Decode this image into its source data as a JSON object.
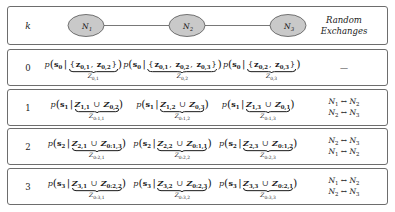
{
  "figure": {
    "k_column_header": "k",
    "exchanges_header_line1": "Random",
    "exchanges_header_line2": "Exchanges",
    "graph": {
      "nodes": [
        {
          "id": "N1",
          "label": "N",
          "sub": "1"
        },
        {
          "id": "N2",
          "label": "N",
          "sub": "2"
        },
        {
          "id": "N3",
          "label": "N",
          "sub": "3"
        }
      ],
      "edges": [
        {
          "from": "N1",
          "to": "N2"
        },
        {
          "from": "N2",
          "to": "N3"
        }
      ],
      "node_fill": "#c9c9c9",
      "node_stroke": "#555555",
      "edge_stroke": "#555555"
    },
    "rows": [
      {
        "k": "0",
        "cells": [
          {
            "prob_sub": "0",
            "set_open": "{",
            "terms": [
              {
                "sym": "z",
                "sub": "0,1"
              },
              {
                "sym": "z",
                "sub": "0,2"
              }
            ],
            "set_close": "}",
            "union": false,
            "brace_label": {
              "sym": "Z",
              "sub": "0,1"
            }
          },
          {
            "prob_sub": "0",
            "set_open": "{",
            "terms": [
              {
                "sym": "z",
                "sub": "0,1"
              },
              {
                "sym": "z",
                "sub": "0,2"
              },
              {
                "sym": "z",
                "sub": "0,3"
              }
            ],
            "set_close": "}",
            "union": false,
            "brace_label": {
              "sym": "Z",
              "sub": "0,2"
            }
          },
          {
            "prob_sub": "0",
            "set_open": "{",
            "terms": [
              {
                "sym": "z",
                "sub": "0,2"
              },
              {
                "sym": "z",
                "sub": "0,3"
              }
            ],
            "set_close": "}",
            "union": false,
            "brace_label": {
              "sym": "Z",
              "sub": "0,3"
            }
          }
        ],
        "exchanges": [
          "—"
        ]
      },
      {
        "k": "1",
        "cells": [
          {
            "prob_sub": "1",
            "union": true,
            "terms": [
              {
                "sym": "Z",
                "sub": "1,1"
              },
              {
                "sym": "Z",
                "sub": "0,2"
              }
            ],
            "brace_label": {
              "sym": "Z",
              "sub": "0:1,1"
            }
          },
          {
            "prob_sub": "1",
            "union": true,
            "terms": [
              {
                "sym": "Z",
                "sub": "1,2"
              },
              {
                "sym": "Z",
                "sub": "0,3"
              }
            ],
            "brace_label": {
              "sym": "Z",
              "sub": "0:1,2"
            }
          },
          {
            "prob_sub": "1",
            "union": true,
            "terms": [
              {
                "sym": "Z",
                "sub": "1,3"
              },
              {
                "sym": "Z",
                "sub": "0,1"
              }
            ],
            "brace_label": {
              "sym": "Z",
              "sub": "0:1,3"
            }
          }
        ],
        "exchanges": [
          "N1 ↔ N2",
          "N2 ↔ N3"
        ]
      },
      {
        "k": "2",
        "cells": [
          {
            "prob_sub": "2",
            "union": true,
            "terms": [
              {
                "sym": "Z",
                "sub": "2,1"
              },
              {
                "sym": "Z",
                "sub": "0:1,3"
              }
            ],
            "brace_label": {
              "sym": "Z",
              "sub": "0:2,1"
            }
          },
          {
            "prob_sub": "2",
            "union": true,
            "terms": [
              {
                "sym": "Z",
                "sub": "2,2"
              },
              {
                "sym": "Z",
                "sub": "0:1,1"
              }
            ],
            "brace_label": {
              "sym": "Z",
              "sub": "0:2,2"
            }
          },
          {
            "prob_sub": "2",
            "union": true,
            "terms": [
              {
                "sym": "Z",
                "sub": "2,3"
              },
              {
                "sym": "Z",
                "sub": "0:1,2"
              }
            ],
            "brace_label": {
              "sym": "Z",
              "sub": "0:2,3"
            }
          }
        ],
        "exchanges": [
          "N2 ↔ N3",
          "N1 ↔ N2"
        ]
      },
      {
        "k": "3",
        "cells": [
          {
            "prob_sub": "3",
            "union": true,
            "terms": [
              {
                "sym": "Z",
                "sub": "3,1"
              },
              {
                "sym": "Z",
                "sub": "0:2,2"
              }
            ],
            "brace_label": {
              "sym": "Z",
              "sub": "0:3,1"
            }
          },
          {
            "prob_sub": "3",
            "union": true,
            "terms": [
              {
                "sym": "Z",
                "sub": "3,2"
              },
              {
                "sym": "Z",
                "sub": "0:2,3"
              }
            ],
            "brace_label": {
              "sym": "Z",
              "sub": "0:3,2"
            }
          },
          {
            "prob_sub": "3",
            "union": true,
            "terms": [
              {
                "sym": "Z",
                "sub": "3,3"
              },
              {
                "sym": "Z",
                "sub": "0:2,1"
              }
            ],
            "brace_label": {
              "sym": "Z",
              "sub": "0:3,3"
            }
          }
        ],
        "exchanges": [
          "N1 ↔ N2",
          "N2 ↔ N3"
        ]
      }
    ],
    "symbols": {
      "prob_fn": "p",
      "state_sym": "s",
      "union_op": "∪",
      "conditional_bar": "|"
    }
  }
}
